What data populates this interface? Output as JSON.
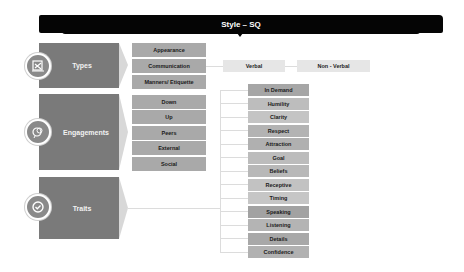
{
  "header": {
    "title": "Style – SQ"
  },
  "categories": [
    {
      "label": "Types",
      "icon": "scissors-document-icon"
    },
    {
      "label": "Engagements",
      "icon": "chat-bubbles-icon"
    },
    {
      "label": "Traits",
      "icon": "check-badge-icon"
    }
  ],
  "types_items": [
    "Appearance",
    "Communication",
    "Manners/ Etiquette"
  ],
  "communication_items": [
    "Verbal",
    "Non - Verbal"
  ],
  "engagement_items": [
    "Down",
    "Up",
    "Peers",
    "External",
    "Social"
  ],
  "trait_items": [
    {
      "label": "In Demand",
      "shade": "#a6a6a6"
    },
    {
      "label": "Humility",
      "shade": "#bdbdbd"
    },
    {
      "label": "Clarity",
      "shade": "#c4c4c4"
    },
    {
      "label": "Respect",
      "shade": "#b3b3b3"
    },
    {
      "label": "Attraction",
      "shade": "#b0b0b0"
    },
    {
      "label": "Goal",
      "shade": "#bcbcbc"
    },
    {
      "label": "Beliefs",
      "shade": "#b8b8b8"
    },
    {
      "label": "Receptive",
      "shade": "#c2c2c2"
    },
    {
      "label": "Timing",
      "shade": "#c6c6c6"
    },
    {
      "label": "Speaking",
      "shade": "#a2a2a2"
    },
    {
      "label": "Listening",
      "shade": "#b4b4b4"
    },
    {
      "label": "Details",
      "shade": "#a8a8a8"
    },
    {
      "label": "Confidence",
      "shade": "#b1b1b1"
    }
  ],
  "colors": {
    "header_bg": "#050505",
    "category_bg": "#7a7a7a",
    "sub_item_bg": "#a9a9a9",
    "comm_item_bg": "#e6e6e6"
  }
}
